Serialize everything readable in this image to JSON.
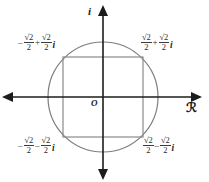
{
  "figure": {
    "background_color": "#ffffff",
    "axis_color": "#1c1c1c",
    "curve_color": "#7a7a7a",
    "label_color": "#2b2b2b"
  },
  "axes": {
    "imaginary_label": "i",
    "real_label": "ℛ",
    "origin_label": "O"
  },
  "circle": {
    "center_x": 103,
    "center_y": 97,
    "radius": 55,
    "stroke": "#7d7d7d"
  },
  "square": {
    "half_side": 40,
    "stroke": "#8a8a8a"
  },
  "points": [
    {
      "id": "top-right",
      "quadrant": 1,
      "real_sign": "",
      "imag_sign": "+",
      "numerator": "√2",
      "denominator": "2",
      "imag_unit": "i",
      "text": "√2/2 + √2/2 i"
    },
    {
      "id": "top-left",
      "quadrant": 2,
      "real_sign": "–",
      "imag_sign": "+",
      "numerator": "√2",
      "denominator": "2",
      "imag_unit": "i",
      "text": "–√2/2 + √2/2 i"
    },
    {
      "id": "bottom-left",
      "quadrant": 3,
      "real_sign": "–",
      "imag_sign": "–",
      "numerator": "√2",
      "denominator": "2",
      "imag_unit": "i",
      "text": "–√2/2 – √2/2 i"
    },
    {
      "id": "bottom-right",
      "quadrant": 4,
      "real_sign": "",
      "imag_sign": "–",
      "numerator": "√2",
      "denominator": "2",
      "imag_unit": "i",
      "text": "√2/2 – √2/2 i"
    }
  ]
}
